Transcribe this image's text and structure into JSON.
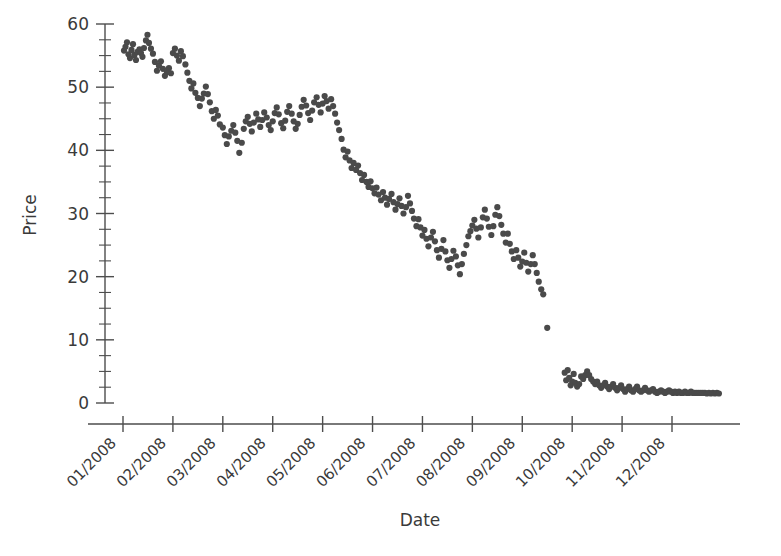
{
  "chart_data": {
    "type": "scatter",
    "title": "",
    "xlabel": "Date",
    "ylabel": "Price",
    "grid": false,
    "legend": null,
    "point_color": "#4a4a4a",
    "background_color": "#ffffff",
    "axis_color": "#4d4d4d",
    "ylim": [
      0,
      60
    ],
    "y_major_ticks": [
      0,
      10,
      20,
      30,
      40,
      50,
      60
    ],
    "y_minor_tick_step": 2.5,
    "xlim": [
      "01/2008",
      "12/2008"
    ],
    "x_tick_labels": [
      "01/2008",
      "02/2008",
      "03/2008",
      "04/2008",
      "05/2008",
      "06/2008",
      "07/2008",
      "08/2008",
      "09/2008",
      "10/2008",
      "11/2008",
      "12/2008"
    ],
    "x_tick_label_rotation_deg": 45,
    "series": [
      {
        "name": "Price",
        "x_unit": "month_fraction_from_01_2008",
        "points": [
          [
            0.02,
            55.8
          ],
          [
            0.05,
            56.4
          ],
          [
            0.08,
            57.1
          ],
          [
            0.11,
            55.2
          ],
          [
            0.14,
            54.6
          ],
          [
            0.17,
            55.9
          ],
          [
            0.2,
            56.8
          ],
          [
            0.23,
            55.1
          ],
          [
            0.26,
            54.3
          ],
          [
            0.29,
            55.6
          ],
          [
            0.33,
            56.0
          ],
          [
            0.36,
            55.4
          ],
          [
            0.39,
            54.8
          ],
          [
            0.42,
            56.2
          ],
          [
            0.46,
            57.4
          ],
          [
            0.49,
            58.3
          ],
          [
            0.52,
            57.0
          ],
          [
            0.56,
            56.1
          ],
          [
            0.6,
            55.3
          ],
          [
            0.64,
            54.0
          ],
          [
            0.68,
            52.6
          ],
          [
            0.72,
            53.4
          ],
          [
            0.76,
            54.1
          ],
          [
            0.8,
            52.9
          ],
          [
            0.84,
            51.8
          ],
          [
            0.88,
            52.4
          ],
          [
            0.92,
            53.0
          ],
          [
            0.96,
            52.2
          ],
          [
            1.0,
            55.4
          ],
          [
            1.04,
            56.1
          ],
          [
            1.08,
            55.0
          ],
          [
            1.12,
            54.2
          ],
          [
            1.16,
            55.7
          ],
          [
            1.2,
            54.9
          ],
          [
            1.25,
            53.6
          ],
          [
            1.29,
            52.3
          ],
          [
            1.33,
            51.0
          ],
          [
            1.37,
            49.8
          ],
          [
            1.41,
            50.6
          ],
          [
            1.45,
            49.1
          ],
          [
            1.5,
            48.3
          ],
          [
            1.54,
            47.0
          ],
          [
            1.58,
            48.2
          ],
          [
            1.62,
            49.0
          ],
          [
            1.66,
            50.1
          ],
          [
            1.7,
            48.9
          ],
          [
            1.74,
            47.6
          ],
          [
            1.78,
            46.2
          ],
          [
            1.82,
            45.0
          ],
          [
            1.86,
            46.4
          ],
          [
            1.9,
            45.5
          ],
          [
            1.94,
            44.1
          ],
          [
            2.0,
            43.6
          ],
          [
            2.04,
            42.4
          ],
          [
            2.08,
            41.0
          ],
          [
            2.12,
            42.2
          ],
          [
            2.17,
            43.1
          ],
          [
            2.21,
            44.0
          ],
          [
            2.25,
            42.8
          ],
          [
            2.29,
            41.5
          ],
          [
            2.33,
            39.6
          ],
          [
            2.38,
            41.2
          ],
          [
            2.42,
            43.4
          ],
          [
            2.46,
            44.6
          ],
          [
            2.5,
            45.3
          ],
          [
            2.54,
            44.2
          ],
          [
            2.58,
            43.0
          ],
          [
            2.62,
            44.4
          ],
          [
            2.67,
            45.8
          ],
          [
            2.71,
            44.9
          ],
          [
            2.75,
            43.7
          ],
          [
            2.79,
            44.8
          ],
          [
            2.83,
            46.0
          ],
          [
            2.88,
            45.2
          ],
          [
            2.92,
            44.0
          ],
          [
            2.96,
            43.2
          ],
          [
            3.0,
            44.6
          ],
          [
            3.04,
            45.9
          ],
          [
            3.08,
            46.8
          ],
          [
            3.12,
            45.7
          ],
          [
            3.17,
            44.3
          ],
          [
            3.21,
            43.5
          ],
          [
            3.25,
            44.7
          ],
          [
            3.29,
            46.1
          ],
          [
            3.33,
            47.0
          ],
          [
            3.38,
            45.8
          ],
          [
            3.42,
            44.6
          ],
          [
            3.46,
            43.4
          ],
          [
            3.5,
            44.2
          ],
          [
            3.54,
            45.6
          ],
          [
            3.58,
            46.9
          ],
          [
            3.62,
            48.0
          ],
          [
            3.67,
            47.1
          ],
          [
            3.71,
            45.9
          ],
          [
            3.75,
            44.8
          ],
          [
            3.79,
            46.3
          ],
          [
            3.83,
            47.6
          ],
          [
            3.88,
            48.4
          ],
          [
            3.92,
            47.2
          ],
          [
            3.96,
            46.0
          ],
          [
            4.0,
            47.4
          ],
          [
            4.04,
            48.6
          ],
          [
            4.08,
            47.8
          ],
          [
            4.12,
            46.6
          ],
          [
            4.17,
            48.1
          ],
          [
            4.21,
            47.0
          ],
          [
            4.25,
            45.8
          ],
          [
            4.29,
            44.4
          ],
          [
            4.33,
            43.2
          ],
          [
            4.38,
            41.8
          ],
          [
            4.42,
            40.1
          ],
          [
            4.46,
            38.9
          ],
          [
            4.5,
            39.8
          ],
          [
            4.54,
            38.4
          ],
          [
            4.58,
            37.2
          ],
          [
            4.62,
            38.0
          ],
          [
            4.67,
            36.9
          ],
          [
            4.71,
            37.6
          ],
          [
            4.75,
            36.4
          ],
          [
            4.79,
            35.3
          ],
          [
            4.83,
            36.1
          ],
          [
            4.88,
            35.0
          ],
          [
            4.92,
            34.2
          ],
          [
            4.96,
            35.1
          ],
          [
            5.0,
            34.0
          ],
          [
            5.04,
            33.2
          ],
          [
            5.08,
            34.1
          ],
          [
            5.12,
            33.0
          ],
          [
            5.17,
            32.1
          ],
          [
            5.21,
            33.4
          ],
          [
            5.25,
            32.5
          ],
          [
            5.29,
            31.4
          ],
          [
            5.33,
            32.3
          ],
          [
            5.38,
            33.1
          ],
          [
            5.42,
            31.8
          ],
          [
            5.46,
            30.6
          ],
          [
            5.5,
            31.5
          ],
          [
            5.54,
            32.4
          ],
          [
            5.58,
            31.2
          ],
          [
            5.62,
            30.0
          ],
          [
            5.67,
            31.0
          ],
          [
            5.71,
            32.8
          ],
          [
            5.75,
            31.6
          ],
          [
            5.79,
            30.4
          ],
          [
            5.83,
            29.2
          ],
          [
            5.88,
            28.0
          ],
          [
            5.92,
            29.1
          ],
          [
            5.96,
            27.8
          ],
          [
            6.0,
            26.5
          ],
          [
            6.04,
            27.4
          ],
          [
            6.08,
            26.0
          ],
          [
            6.12,
            24.8
          ],
          [
            6.17,
            26.2
          ],
          [
            6.21,
            27.1
          ],
          [
            6.25,
            25.6
          ],
          [
            6.29,
            24.2
          ],
          [
            6.33,
            23.0
          ],
          [
            6.38,
            24.4
          ],
          [
            6.42,
            25.8
          ],
          [
            6.46,
            24.0
          ],
          [
            6.5,
            22.6
          ],
          [
            6.54,
            21.4
          ],
          [
            6.58,
            22.8
          ],
          [
            6.62,
            24.1
          ],
          [
            6.67,
            23.2
          ],
          [
            6.71,
            21.8
          ],
          [
            6.75,
            20.4
          ],
          [
            6.79,
            22.0
          ],
          [
            6.83,
            23.6
          ],
          [
            6.88,
            25.0
          ],
          [
            6.92,
            26.4
          ],
          [
            6.96,
            27.2
          ],
          [
            7.0,
            28.1
          ],
          [
            7.04,
            29.0
          ],
          [
            7.08,
            27.6
          ],
          [
            7.12,
            26.2
          ],
          [
            7.17,
            27.8
          ],
          [
            7.21,
            29.4
          ],
          [
            7.25,
            30.6
          ],
          [
            7.29,
            29.2
          ],
          [
            7.33,
            27.9
          ],
          [
            7.38,
            26.6
          ],
          [
            7.42,
            28.0
          ],
          [
            7.46,
            29.8
          ],
          [
            7.5,
            31.0
          ],
          [
            7.54,
            29.6
          ],
          [
            7.58,
            28.2
          ],
          [
            7.62,
            26.8
          ],
          [
            7.67,
            25.4
          ],
          [
            7.71,
            26.8
          ],
          [
            7.75,
            25.2
          ],
          [
            7.79,
            24.0
          ],
          [
            7.83,
            22.8
          ],
          [
            7.88,
            24.2
          ],
          [
            7.92,
            23.0
          ],
          [
            7.96,
            21.6
          ],
          [
            8.0,
            22.4
          ],
          [
            8.04,
            23.8
          ],
          [
            8.08,
            22.2
          ],
          [
            8.12,
            20.8
          ],
          [
            8.17,
            22.0
          ],
          [
            8.21,
            23.4
          ],
          [
            8.25,
            22.0
          ],
          [
            8.29,
            20.6
          ],
          [
            8.33,
            19.2
          ],
          [
            8.38,
            18.0
          ],
          [
            8.42,
            17.2
          ],
          [
            8.5,
            11.9
          ],
          [
            8.85,
            4.8
          ],
          [
            8.88,
            3.6
          ],
          [
            8.91,
            5.2
          ],
          [
            8.94,
            4.0
          ],
          [
            8.97,
            2.8
          ],
          [
            9.0,
            3.4
          ],
          [
            9.03,
            4.6
          ],
          [
            9.06,
            3.2
          ],
          [
            9.1,
            2.6
          ],
          [
            9.14,
            3.0
          ],
          [
            9.18,
            4.2
          ],
          [
            9.22,
            3.8
          ],
          [
            9.26,
            4.4
          ],
          [
            9.3,
            5.0
          ],
          [
            9.34,
            4.4
          ],
          [
            9.38,
            3.8
          ],
          [
            9.42,
            3.4
          ],
          [
            9.46,
            3.0
          ],
          [
            9.5,
            3.4
          ],
          [
            9.54,
            2.8
          ],
          [
            9.58,
            2.4
          ],
          [
            9.62,
            2.8
          ],
          [
            9.66,
            3.2
          ],
          [
            9.7,
            2.6
          ],
          [
            9.74,
            2.2
          ],
          [
            9.78,
            2.6
          ],
          [
            9.82,
            3.0
          ],
          [
            9.86,
            2.4
          ],
          [
            9.9,
            2.0
          ],
          [
            9.94,
            2.4
          ],
          [
            9.98,
            2.8
          ],
          [
            10.02,
            2.2
          ],
          [
            10.06,
            1.8
          ],
          [
            10.1,
            2.2
          ],
          [
            10.14,
            2.6
          ],
          [
            10.18,
            2.0
          ],
          [
            10.22,
            1.8
          ],
          [
            10.26,
            2.2
          ],
          [
            10.3,
            2.6
          ],
          [
            10.34,
            2.0
          ],
          [
            10.38,
            1.8
          ],
          [
            10.42,
            2.0
          ],
          [
            10.46,
            2.4
          ],
          [
            10.5,
            2.0
          ],
          [
            10.54,
            1.8
          ],
          [
            10.58,
            2.0
          ],
          [
            10.62,
            2.2
          ],
          [
            10.66,
            1.8
          ],
          [
            10.7,
            1.6
          ],
          [
            10.74,
            1.8
          ],
          [
            10.78,
            2.0
          ],
          [
            10.82,
            1.8
          ],
          [
            10.86,
            1.6
          ],
          [
            10.9,
            1.8
          ],
          [
            10.94,
            2.0
          ],
          [
            10.98,
            1.8
          ],
          [
            11.02,
            1.6
          ],
          [
            11.06,
            1.8
          ],
          [
            11.1,
            1.6
          ],
          [
            11.14,
            1.8
          ],
          [
            11.18,
            1.6
          ],
          [
            11.22,
            1.6
          ],
          [
            11.26,
            1.8
          ],
          [
            11.3,
            1.6
          ],
          [
            11.34,
            1.6
          ],
          [
            11.38,
            1.8
          ],
          [
            11.42,
            1.6
          ],
          [
            11.46,
            1.6
          ],
          [
            11.5,
            1.6
          ],
          [
            11.54,
            1.6
          ],
          [
            11.58,
            1.6
          ],
          [
            11.62,
            1.6
          ],
          [
            11.66,
            1.6
          ],
          [
            11.7,
            1.5
          ],
          [
            11.74,
            1.6
          ],
          [
            11.78,
            1.5
          ],
          [
            11.82,
            1.6
          ],
          [
            11.86,
            1.5
          ],
          [
            11.9,
            1.6
          ],
          [
            11.94,
            1.5
          ]
        ]
      }
    ]
  }
}
